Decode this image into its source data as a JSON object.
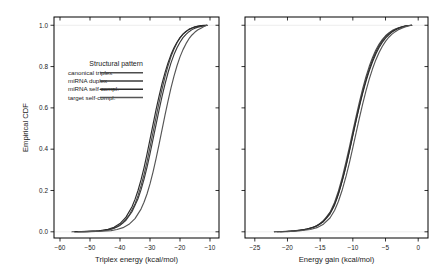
{
  "figure": {
    "background_color": "#ffffff",
    "frame_color": "#000000",
    "gridline_color": "#e8e8e8"
  },
  "legend": {
    "title": "Structural pattern",
    "position": "upper-left-inside-panel-1",
    "entries": [
      {
        "label": "canonical triplex",
        "color": "#4d4d4d"
      },
      {
        "label": "miRNA duplex",
        "color": "#3a3a3a"
      },
      {
        "label": "miRNA self-compl.",
        "color": "#2b2b2b"
      },
      {
        "label": "target self-compl.",
        "color": "#555555"
      }
    ]
  },
  "chart_data": [
    {
      "type": "line",
      "panel": "left",
      "title": "",
      "xlabel": "Triplex energy (kcal/mol)",
      "ylabel": "Empirical CDF",
      "xlim": [
        -62,
        -7
      ],
      "ylim": [
        -0.03,
        1.04
      ],
      "xticks": [
        -60,
        -50,
        -40,
        -30,
        -20,
        -10
      ],
      "xticklabels": [
        "−60",
        "−50",
        "−40",
        "−30",
        "−20",
        "−10"
      ],
      "yticks": [
        0.0,
        0.2,
        0.4,
        0.6,
        0.8,
        1.0
      ],
      "yticklabels": [
        "0.0",
        "0.2",
        "0.4",
        "0.6",
        "0.8",
        "1.0"
      ],
      "grid": false,
      "legend_position": "upper left",
      "series": [
        {
          "name": "canonical triplex",
          "color": "#4d4d4d",
          "x": [
            -56,
            -52,
            -48,
            -45,
            -43,
            -41,
            -39,
            -37,
            -35,
            -34,
            -33,
            -32,
            -31,
            -30,
            -29,
            -28,
            -27,
            -26,
            -25,
            -24,
            -23,
            -22,
            -21,
            -20,
            -19,
            -18,
            -17,
            -16,
            -15,
            -13,
            -11
          ],
          "y": [
            0.0,
            0.001,
            0.003,
            0.007,
            0.013,
            0.024,
            0.044,
            0.079,
            0.135,
            0.175,
            0.222,
            0.277,
            0.34,
            0.41,
            0.482,
            0.554,
            0.624,
            0.69,
            0.75,
            0.803,
            0.848,
            0.885,
            0.915,
            0.939,
            0.957,
            0.97,
            0.98,
            0.987,
            0.992,
            0.998,
            1.0
          ]
        },
        {
          "name": "miRNA duplex",
          "color": "#3a3a3a",
          "x": [
            -55,
            -51,
            -47,
            -44,
            -42,
            -40,
            -38,
            -36,
            -34,
            -33,
            -32,
            -31,
            -30,
            -29,
            -28,
            -27,
            -26,
            -25,
            -24,
            -23,
            -22,
            -21,
            -20,
            -19,
            -18,
            -17,
            -16,
            -15,
            -14,
            -12,
            -11
          ],
          "y": [
            0.0,
            0.001,
            0.004,
            0.009,
            0.017,
            0.031,
            0.056,
            0.097,
            0.16,
            0.203,
            0.254,
            0.312,
            0.377,
            0.447,
            0.518,
            0.588,
            0.654,
            0.715,
            0.77,
            0.818,
            0.858,
            0.891,
            0.918,
            0.94,
            0.956,
            0.969,
            0.979,
            0.986,
            0.991,
            0.997,
            1.0
          ]
        },
        {
          "name": "miRNA self-compl.",
          "color": "#2b2b2b",
          "x": [
            -55,
            -51,
            -47,
            -44,
            -42,
            -40,
            -38,
            -36,
            -35,
            -34,
            -33,
            -32,
            -31,
            -30,
            -29,
            -28,
            -27,
            -26,
            -25,
            -24,
            -23,
            -22,
            -21,
            -20,
            -19,
            -18,
            -17,
            -16,
            -15,
            -13,
            -11
          ],
          "y": [
            0.0,
            0.002,
            0.005,
            0.012,
            0.022,
            0.04,
            0.071,
            0.121,
            0.157,
            0.2,
            0.251,
            0.31,
            0.376,
            0.447,
            0.519,
            0.59,
            0.656,
            0.717,
            0.771,
            0.818,
            0.858,
            0.891,
            0.918,
            0.94,
            0.957,
            0.97,
            0.98,
            0.987,
            0.992,
            0.998,
            1.0
          ]
        },
        {
          "name": "target self-compl.",
          "color": "#555555",
          "x": [
            -54,
            -50,
            -46,
            -43,
            -41,
            -39,
            -37,
            -35,
            -33,
            -32,
            -31,
            -30,
            -29,
            -28,
            -27,
            -26,
            -25,
            -24,
            -23,
            -22,
            -21,
            -20,
            -19,
            -18,
            -17,
            -16,
            -15,
            -14,
            -13,
            -12,
            -11
          ],
          "y": [
            0.0,
            0.001,
            0.003,
            0.006,
            0.011,
            0.02,
            0.036,
            0.064,
            0.11,
            0.143,
            0.183,
            0.232,
            0.289,
            0.353,
            0.422,
            0.494,
            0.565,
            0.633,
            0.697,
            0.754,
            0.804,
            0.847,
            0.882,
            0.911,
            0.935,
            0.953,
            0.967,
            0.978,
            0.986,
            0.994,
            1.0
          ]
        }
      ]
    },
    {
      "type": "line",
      "panel": "right",
      "title": "",
      "xlabel": "Energy gain (kcal/mol)",
      "ylabel": "",
      "xlim": [
        -26.5,
        1.5
      ],
      "ylim": [
        -0.03,
        1.04
      ],
      "xticks": [
        -25,
        -20,
        -15,
        -10,
        -5,
        0
      ],
      "xticklabels": [
        "−25",
        "−20",
        "−15",
        "−10",
        "−5",
        "0"
      ],
      "yticks": [
        0.0,
        0.2,
        0.4,
        0.6,
        0.8,
        1.0
      ],
      "yticklabels": [
        "",
        "",
        "",
        "",
        "",
        ""
      ],
      "grid": false,
      "legend_position": "none",
      "series": [
        {
          "name": "canonical triplex",
          "color": "#4d4d4d",
          "x": [
            -22.0,
            -20.0,
            -18.0,
            -16.5,
            -15.5,
            -14.5,
            -13.5,
            -12.8,
            -12.2,
            -11.6,
            -11.0,
            -10.5,
            -10.0,
            -9.5,
            -9.0,
            -8.5,
            -8.0,
            -7.5,
            -7.0,
            -6.5,
            -6.0,
            -5.5,
            -5.0,
            -4.5,
            -4.0,
            -3.5,
            -3.0,
            -2.5,
            -2.0,
            -1.5,
            -1.0
          ],
          "y": [
            0.0,
            0.002,
            0.007,
            0.016,
            0.029,
            0.053,
            0.094,
            0.142,
            0.198,
            0.266,
            0.344,
            0.414,
            0.487,
            0.559,
            0.628,
            0.692,
            0.75,
            0.8,
            0.843,
            0.879,
            0.908,
            0.931,
            0.949,
            0.963,
            0.974,
            0.982,
            0.988,
            0.993,
            0.996,
            0.999,
            1.0
          ]
        },
        {
          "name": "miRNA duplex",
          "color": "#3a3a3a",
          "x": [
            -21.5,
            -19.5,
            -17.5,
            -16.0,
            -15.0,
            -14.0,
            -13.2,
            -12.5,
            -11.9,
            -11.3,
            -10.8,
            -10.3,
            -9.8,
            -9.3,
            -8.8,
            -8.3,
            -7.8,
            -7.3,
            -6.8,
            -6.3,
            -5.8,
            -5.3,
            -4.8,
            -4.3,
            -3.8,
            -3.3,
            -2.8,
            -2.3,
            -1.8,
            -1.4,
            -1.0
          ],
          "y": [
            0.0,
            0.003,
            0.01,
            0.022,
            0.039,
            0.07,
            0.107,
            0.157,
            0.217,
            0.287,
            0.354,
            0.425,
            0.498,
            0.569,
            0.637,
            0.7,
            0.757,
            0.806,
            0.848,
            0.883,
            0.911,
            0.934,
            0.951,
            0.965,
            0.975,
            0.983,
            0.989,
            0.993,
            0.997,
            0.999,
            1.0
          ]
        },
        {
          "name": "miRNA self-compl.",
          "color": "#2b2b2b",
          "x": [
            -21.0,
            -19.0,
            -17.0,
            -15.5,
            -14.5,
            -13.5,
            -12.8,
            -12.2,
            -11.6,
            -11.0,
            -10.5,
            -10.0,
            -9.5,
            -9.0,
            -8.5,
            -8.0,
            -7.5,
            -7.0,
            -6.5,
            -6.0,
            -5.5,
            -5.0,
            -4.5,
            -4.0,
            -3.5,
            -3.0,
            -2.5,
            -2.0,
            -1.6,
            -1.3,
            -1.0
          ],
          "y": [
            0.0,
            0.004,
            0.013,
            0.028,
            0.049,
            0.086,
            0.129,
            0.183,
            0.249,
            0.324,
            0.394,
            0.467,
            0.539,
            0.607,
            0.67,
            0.727,
            0.778,
            0.822,
            0.86,
            0.891,
            0.917,
            0.938,
            0.954,
            0.967,
            0.977,
            0.985,
            0.991,
            0.996,
            0.998,
            0.999,
            1.0
          ]
        },
        {
          "name": "target self-compl.",
          "color": "#555555",
          "x": [
            -22.0,
            -20.0,
            -18.0,
            -16.5,
            -15.5,
            -14.5,
            -13.5,
            -12.8,
            -12.2,
            -11.6,
            -11.0,
            -10.5,
            -10.0,
            -9.5,
            -9.0,
            -8.5,
            -8.0,
            -7.5,
            -7.0,
            -6.5,
            -6.0,
            -5.5,
            -5.0,
            -4.5,
            -4.0,
            -3.5,
            -3.0,
            -2.5,
            -2.0,
            -1.5,
            -1.0
          ],
          "y": [
            0.0,
            0.001,
            0.005,
            0.011,
            0.02,
            0.037,
            0.067,
            0.103,
            0.148,
            0.205,
            0.273,
            0.337,
            0.407,
            0.479,
            0.55,
            0.618,
            0.681,
            0.738,
            0.788,
            0.831,
            0.867,
            0.897,
            0.922,
            0.942,
            0.957,
            0.969,
            0.979,
            0.986,
            0.992,
            0.997,
            1.0
          ]
        }
      ]
    }
  ]
}
